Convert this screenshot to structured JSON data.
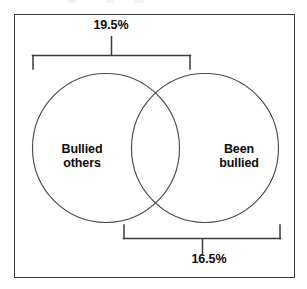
{
  "figure": {
    "type": "venn-diagram",
    "title": "",
    "frame": {
      "border_color": "#3a3a3a",
      "background": "#ffffff"
    },
    "sets": [
      {
        "id": "bullied-others",
        "label": "Bullied\nothers",
        "position": "left",
        "outline_color": "#4a4a4a"
      },
      {
        "id": "been-bullied",
        "label": "Been\nbullied",
        "position": "right",
        "outline_color": "#4a4a4a"
      }
    ],
    "annotations": [
      {
        "id": "top-bracket",
        "value": "19.5%",
        "placement": "top",
        "spans": [
          "bullied-others"
        ],
        "bracket_color": "#3b3b3b"
      },
      {
        "id": "bottom-bracket",
        "value": "16.5%",
        "placement": "bottom",
        "spans": [
          "been-bullied"
        ],
        "bracket_color": "#3b3b3b"
      }
    ]
  }
}
